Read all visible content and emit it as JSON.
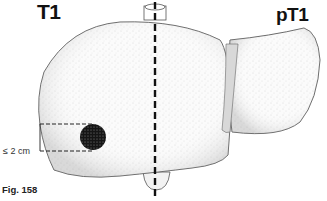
{
  "labels": {
    "left_stage": "T1",
    "right_stage": "pT1",
    "figure_caption": "Fig. 158",
    "size_annotation": "≤ 2 cm"
  },
  "diagram": {
    "elements": [
      "right-lobe",
      "left-lobe",
      "falciform-ligament",
      "inferior-vena-cava",
      "gallbladder",
      "solitary-tumor",
      "dashed-midline",
      "size-bracket"
    ],
    "colors": {
      "outline": "#444444",
      "stipple": "#bdbdbd",
      "tumor": "#111111",
      "dashed_line": "#111111"
    }
  }
}
